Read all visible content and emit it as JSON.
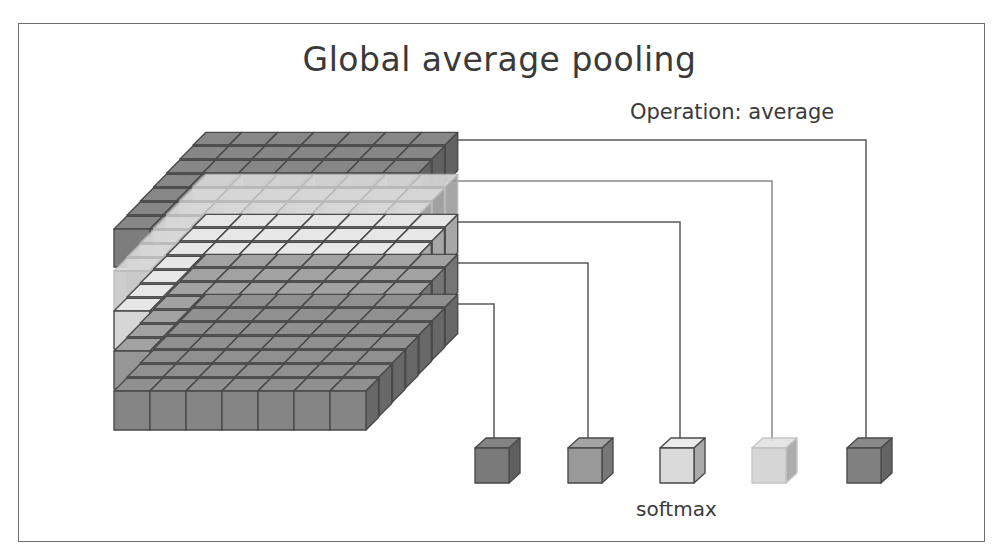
{
  "diagram": {
    "title": "Global average pooling",
    "operation_label": "Operation: average",
    "output_label": "softmax",
    "frame": {
      "x": 18,
      "y": 23,
      "w": 967,
      "h": 519,
      "stroke": "#6e6e6e"
    },
    "feature_map": {
      "columns": 7,
      "depth_rows": 7,
      "front_x": 114,
      "cell_w": 36,
      "depth_dx": 13.2,
      "depth_dy": -14,
      "top_face_color": "#9a9a9a",
      "layers": [
        {
          "name": "channel-1",
          "color": "#7d7d7d",
          "front_top": 229,
          "height": 38
        },
        {
          "name": "channel-2",
          "color": "#c9c9c9",
          "front_top": 271,
          "height": 38,
          "faded": true
        },
        {
          "name": "channel-3",
          "color": "#d6d6d6",
          "front_top": 311,
          "height": 38
        },
        {
          "name": "channel-4",
          "color": "#969696",
          "front_top": 351,
          "height": 38
        },
        {
          "name": "channel-5",
          "color": "#858585",
          "front_top": 391,
          "height": 39
        }
      ]
    },
    "connectors": [
      {
        "from_y": 304,
        "to_x": 494,
        "color": "#5a5a5a"
      },
      {
        "from_y": 263,
        "to_x": 588,
        "color": "#5a5a5a"
      },
      {
        "from_y": 222,
        "to_x": 680,
        "color": "#5a5a5a"
      },
      {
        "from_y": 181,
        "to_x": 772,
        "color": "#8a8a8a"
      },
      {
        "from_y": 140,
        "to_x": 866,
        "color": "#5a5a5a"
      }
    ],
    "outputs": [
      {
        "x": 475,
        "color": "#7a7a7a"
      },
      {
        "x": 568,
        "color": "#999999"
      },
      {
        "x": 660,
        "color": "#dadada"
      },
      {
        "x": 752,
        "color": "#d2d2d2",
        "faded": true
      },
      {
        "x": 847,
        "color": "#808080"
      }
    ],
    "output_cube": {
      "y": 448,
      "w": 34,
      "h": 35,
      "dx": 11,
      "dy": -10
    }
  }
}
